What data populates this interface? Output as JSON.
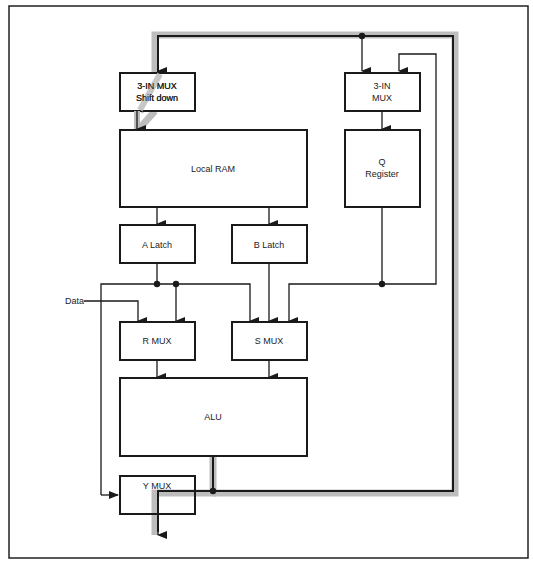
{
  "diagram": {
    "blocks": {
      "shift_mux": {
        "line1": "3-IN MUX",
        "line2": "Shift down"
      },
      "q_mux": {
        "line1": "3-IN",
        "line2": "MUX"
      },
      "local_ram": {
        "label": "Local RAM"
      },
      "q_register": {
        "line1": "Q",
        "line2": "Register"
      },
      "a_latch": {
        "label": "A Latch"
      },
      "b_latch": {
        "label": "B Latch"
      },
      "r_mux": {
        "label": "R MUX"
      },
      "s_mux": {
        "label": "S MUX"
      },
      "alu": {
        "label": "ALU"
      },
      "y_mux": {
        "label": "Y MUX"
      }
    },
    "inputs": {
      "data": "Data"
    },
    "colors": {
      "line": "#1a1a1a",
      "bus_highlight": "#bdbdbd",
      "background": "#ffffff"
    }
  }
}
